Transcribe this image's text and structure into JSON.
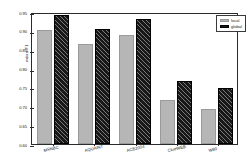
{
  "chart_data": {
    "type": "bar",
    "title": "",
    "xlabel": "",
    "ylabel": "micro-F1",
    "ylim": [
      0.6,
      0.95
    ],
    "yticks": [
      "0.95",
      "0.90",
      "0.85",
      "0.80",
      "0.75",
      "0.70",
      "0.65",
      "0.60"
    ],
    "ytick_values": [
      0.95,
      0.9,
      0.85,
      0.8,
      0.75,
      0.7,
      0.65,
      0.6
    ],
    "grid": false,
    "legend_position": "top-right",
    "categories": [
      "MSNBC",
      "AQUAINT",
      "ACE2004",
      "ClueWEB",
      "W80"
    ],
    "series": [
      {
        "name": "local",
        "color": "#b6b6b6",
        "values": [
          0.902,
          0.866,
          0.888,
          0.716,
          0.693
        ]
      },
      {
        "name": "global",
        "color": "#181818",
        "hatch": "diagonal",
        "values": [
          0.942,
          0.906,
          0.932,
          0.767,
          0.749
        ]
      }
    ]
  },
  "legend": {
    "items": [
      {
        "label": "local",
        "swatch": "local"
      },
      {
        "label": "global",
        "swatch": "global"
      }
    ]
  }
}
